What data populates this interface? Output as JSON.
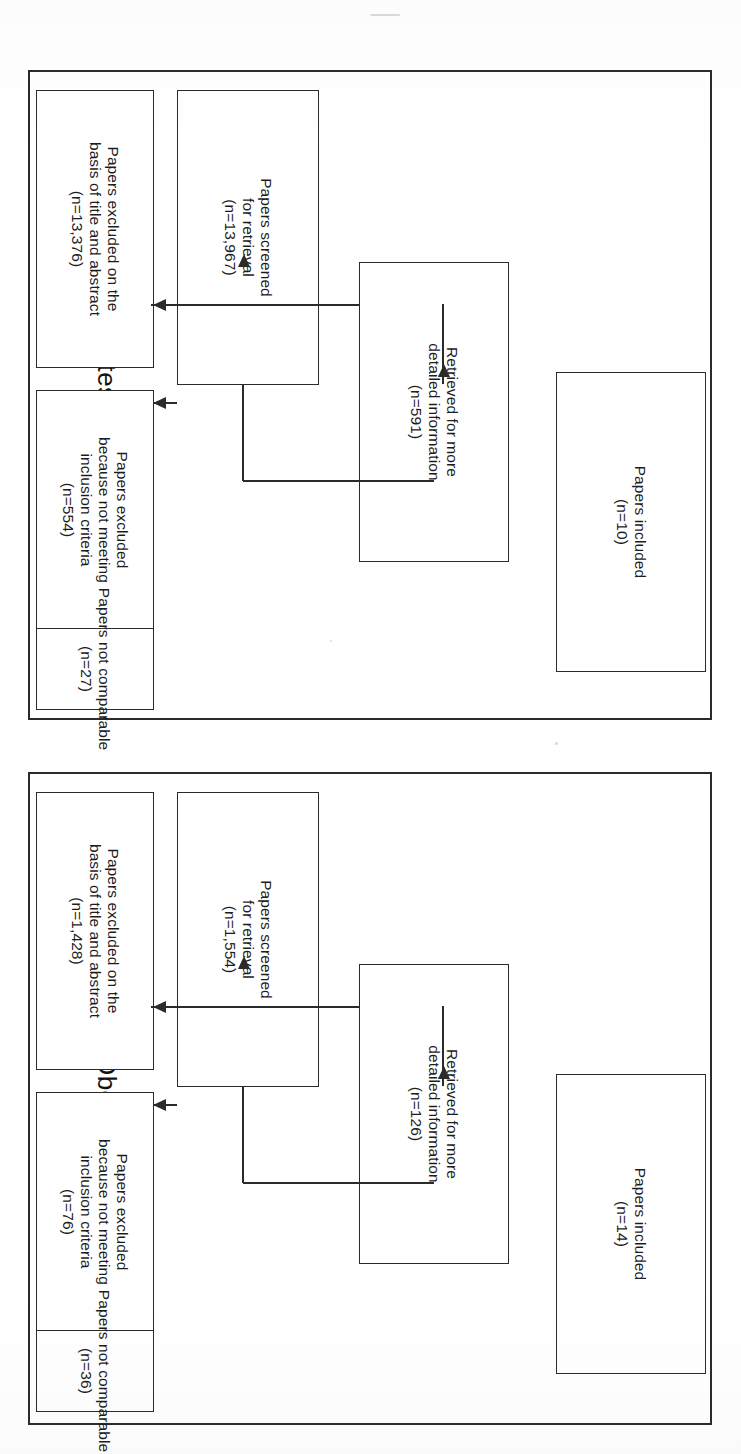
{
  "figure": {
    "orientation": "rotated-90-clockwise",
    "ink_color": "#2b2b2b",
    "background_color": "#ffffff"
  },
  "panels": [
    {
      "id": "diabetes",
      "title": "Diabetes mellitus",
      "nodes": {
        "screened": {
          "line1": "Papers screened",
          "line2": "for retrieval",
          "line3": "(n=13,967)"
        },
        "retrieved": {
          "line1": "Retrieved for more",
          "line2": "detailed information",
          "line3": "(n=591)"
        },
        "included": {
          "line1": "Papers included",
          "line2": "(n=10)",
          "line3": ""
        },
        "excluded_title_abstract": {
          "line1": "Papers excluded on the",
          "line2": "basis of title and abstract",
          "line3": "(n=13,376)"
        },
        "excluded_criteria": {
          "line1": "Papers excluded",
          "line2": "because not meeting",
          "line3": "inclusion criteria",
          "line4": "(n=554)"
        },
        "not_comparable": {
          "line1": "Papers not comparable",
          "line2": "(n=36)",
          "line3": ""
        }
      }
    },
    {
      "id": "obesity",
      "title": "Obesity",
      "nodes": {
        "screened": {
          "line1": "Papers screened",
          "line2": "for retrieval",
          "line3": "(n=1,554)"
        },
        "retrieved": {
          "line1": "Retrieved for more",
          "line2": "detailed information",
          "line3": "(n=126)"
        },
        "included": {
          "line1": "Papers included",
          "line2": "(n=14)",
          "line3": ""
        },
        "excluded_title_abstract": {
          "line1": "Papers excluded on the",
          "line2": "basis of title and abstract",
          "line3": "(n=1,428)"
        },
        "excluded_criteria": {
          "line1": "Papers excluded",
          "line2": "because not meeting",
          "line3": "inclusion criteria",
          "line4": "(n=76)"
        },
        "not_comparable": {
          "line1": "Papers not comparable",
          "line2": "(n=36)",
          "line3": ""
        }
      }
    }
  ],
  "overrides": {
    "diabetes_not_comparable_count": "(n=27)",
    "obesity_not_comparable_count": "(n=36)"
  }
}
